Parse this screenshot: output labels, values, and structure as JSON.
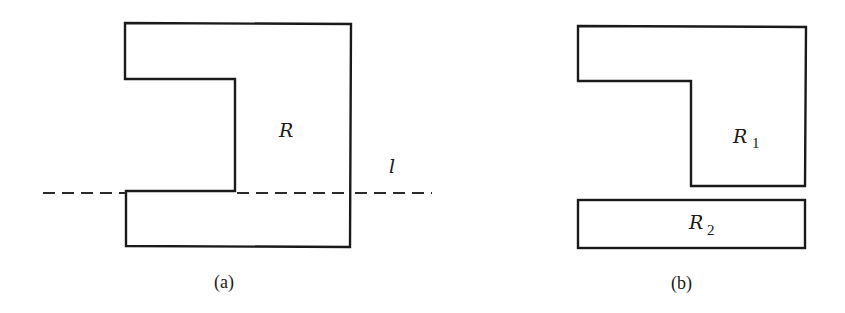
{
  "figure_a": {
    "caption": "(a)",
    "region_label": "R",
    "line_label": "l"
  },
  "figure_b": {
    "caption": "(b)",
    "region1_label": "R",
    "region1_subscript": "1",
    "region2_label": "R",
    "region2_subscript": "2"
  },
  "colors": {
    "stroke": "#1a1a1a",
    "background": "#ffffff"
  }
}
